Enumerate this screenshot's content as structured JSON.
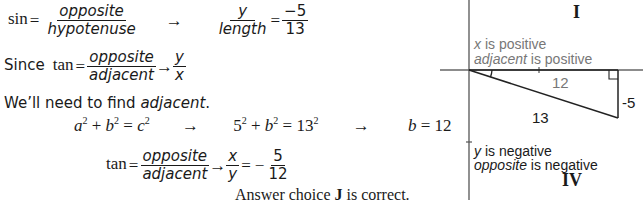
{
  "solution": {
    "line1": {
      "lhs": "sin",
      "eq": "=",
      "frac_num": "opposite",
      "frac_den": "hypotenuse",
      "arrow": "→",
      "frac2_num": "y",
      "frac2_den": "length",
      "eq2": "=",
      "frac3_num": "−5",
      "frac3_den": "13"
    },
    "line2": {
      "prefix": "Since",
      "lhs": "tan",
      "eq": "=",
      "frac_num": "opposite",
      "frac_den": "adjacent",
      "arrow": "→",
      "frac2_num": "y",
      "frac2_den": "x"
    },
    "line3": {
      "text": "We’ll need to find ",
      "emph": "adjacent",
      "end": "."
    },
    "line4": {
      "eq1_a": "a",
      "eq1_b": "b",
      "eq1_c": "c",
      "exp": "2",
      "arrow1": "→",
      "eq2_base1": "5",
      "eq2_b": "b",
      "eq2_base2": "13",
      "arrow2": "→",
      "result_var": "b",
      "result_val": "12"
    },
    "line5": {
      "lhs": "tan",
      "eq": "=",
      "frac_num": "opposite",
      "frac_den": "adjacent",
      "arrow": "→",
      "frac2_num": "x",
      "frac2_den": "y",
      "eq2": "=",
      "sign": "−",
      "frac3_num": "5",
      "frac3_den": "12"
    },
    "answer": {
      "prefix": "Answer choice ",
      "choice": "J",
      "suffix": " is correct."
    }
  },
  "diagram": {
    "quadrant_top": "I",
    "quadrant_bottom": "IV",
    "top_note_line1_var": "x",
    "top_note_line1_rest": " is positive",
    "top_note_line2_var": "adjacent",
    "top_note_line2_rest": " is positive",
    "bottom_note_line1_var": "y",
    "bottom_note_line1_rest": " is negative",
    "bottom_note_line2_var": "opposite",
    "bottom_note_line2_rest": " is negative",
    "side_adjacent": "12",
    "side_opposite": "-5",
    "side_hypotenuse": "13",
    "colors": {
      "axis": "#555555",
      "triangle": "#222222",
      "gray_text": "#777777"
    }
  }
}
